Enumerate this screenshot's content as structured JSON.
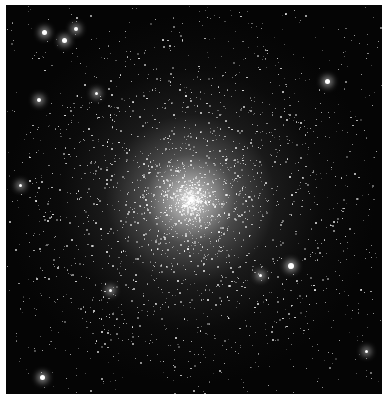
{
  "image": {
    "subject": "Globular star cluster",
    "background_color": "#050505",
    "border_color": "#ffffff",
    "core_center_pct": [
      49,
      50
    ]
  },
  "bright_stars": [
    {
      "x": 44,
      "y": 32,
      "r": 2.5
    },
    {
      "x": 64,
      "y": 40,
      "r": 2.5
    },
    {
      "x": 76,
      "y": 29,
      "r": 2
    },
    {
      "x": 39,
      "y": 100,
      "r": 2
    },
    {
      "x": 96,
      "y": 93,
      "r": 1.5
    },
    {
      "x": 327,
      "y": 81,
      "r": 2.5
    },
    {
      "x": 291,
      "y": 266,
      "r": 3
    },
    {
      "x": 42,
      "y": 377,
      "r": 2.5
    },
    {
      "x": 366,
      "y": 351,
      "r": 1.5
    },
    {
      "x": 260,
      "y": 275,
      "r": 1.5
    },
    {
      "x": 110,
      "y": 290,
      "r": 1.5
    },
    {
      "x": 20,
      "y": 185,
      "r": 1.5
    }
  ]
}
